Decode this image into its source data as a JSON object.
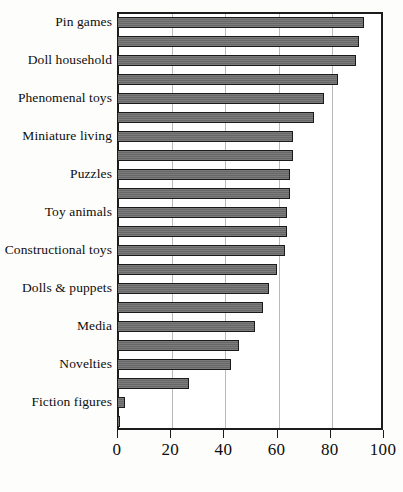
{
  "chart_data": {
    "type": "bar",
    "orientation": "horizontal",
    "title": "",
    "subtitle": "",
    "xlabel": "",
    "ylabel": "",
    "xlim": [
      0,
      100
    ],
    "grid": true,
    "legend": null,
    "xticks": [
      "0",
      "20",
      "40",
      "60",
      "80",
      "100"
    ],
    "xtick_values": [
      0,
      20,
      40,
      60,
      80,
      100
    ],
    "labelled_categories": [
      "Pin games",
      "Doll household",
      "Phenomenal toys",
      "Miniature living",
      "Puzzles",
      "Toy animals",
      "Constructional toys",
      "Dolls & puppets",
      "Media",
      "Novelties",
      "Fiction figures"
    ],
    "bars": [
      {
        "index": 0,
        "label": "Pin games",
        "value": 93
      },
      {
        "index": 1,
        "label": "",
        "value": 91
      },
      {
        "index": 2,
        "label": "Doll household",
        "value": 90
      },
      {
        "index": 3,
        "label": "",
        "value": 83
      },
      {
        "index": 4,
        "label": "Phenomenal toys",
        "value": 78
      },
      {
        "index": 5,
        "label": "",
        "value": 74
      },
      {
        "index": 6,
        "label": "Miniature living",
        "value": 66
      },
      {
        "index": 7,
        "label": "",
        "value": 66
      },
      {
        "index": 8,
        "label": "Puzzles",
        "value": 65
      },
      {
        "index": 9,
        "label": "",
        "value": 65
      },
      {
        "index": 10,
        "label": "Toy animals",
        "value": 64
      },
      {
        "index": 11,
        "label": "",
        "value": 64
      },
      {
        "index": 12,
        "label": "Constructional toys",
        "value": 63
      },
      {
        "index": 13,
        "label": "",
        "value": 60
      },
      {
        "index": 14,
        "label": "Dolls & puppets",
        "value": 57
      },
      {
        "index": 15,
        "label": "",
        "value": 55
      },
      {
        "index": 16,
        "label": "Media",
        "value": 52
      },
      {
        "index": 17,
        "label": "",
        "value": 46
      },
      {
        "index": 18,
        "label": "Novelties",
        "value": 43
      },
      {
        "index": 19,
        "label": "",
        "value": 27
      },
      {
        "index": 20,
        "label": "Fiction figures",
        "value": 3
      },
      {
        "index": 21,
        "label": "",
        "value": 1
      }
    ],
    "colors": {
      "bar_fill": "#6d6d6d",
      "bar_border": "#1a1a1a",
      "gridline": "#b9b9b9",
      "axis": "#1c1c1c",
      "background": "#fdfdfb",
      "plot_background": "#ffffff",
      "text": "#0d0d0d"
    }
  }
}
